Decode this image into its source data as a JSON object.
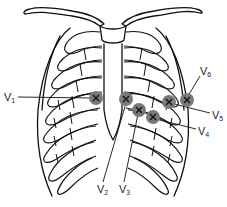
{
  "diagram": {
    "electrode_color": "#7a7a7a",
    "electrode_marker": "X",
    "line_color": "#111111",
    "leads": [
      {
        "id": "V1",
        "base": "V",
        "sub": "1",
        "x": 96,
        "y": 98,
        "label_x": 4,
        "label_y": 92
      },
      {
        "id": "V2",
        "base": "V",
        "sub": "2",
        "x": 126,
        "y": 99,
        "label_x": 97,
        "label_y": 185
      },
      {
        "id": "V3",
        "base": "V",
        "sub": "3",
        "x": 139,
        "y": 110,
        "label_x": 119,
        "label_y": 185
      },
      {
        "id": "V4",
        "base": "V",
        "sub": "4",
        "x": 153,
        "y": 117,
        "label_x": 198,
        "label_y": 126
      },
      {
        "id": "V5",
        "base": "V",
        "sub": "5",
        "x": 169,
        "y": 102,
        "label_x": 212,
        "label_y": 110
      },
      {
        "id": "V6",
        "base": "V",
        "sub": "6",
        "x": 186,
        "y": 100,
        "label_x": 200,
        "label_y": 67
      }
    ]
  }
}
